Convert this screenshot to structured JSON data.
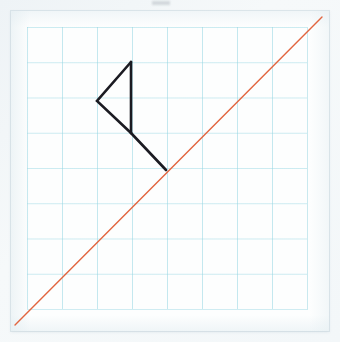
{
  "scene": {
    "title": "Hand drawing on graph paper",
    "width": 340,
    "height": 342,
    "background_color": "#f2f6f8",
    "paper_color": "#fdfefe",
    "grid_color": "#96d6e2",
    "grid_spacing_px": 35
  },
  "drawing": {
    "diagonal_line": {
      "label": "orange diagonal line",
      "color": "#e2653f",
      "stroke_width": 1.4,
      "x1": 15,
      "y1": 325,
      "x2": 322,
      "y2": 17
    },
    "flag": {
      "label": "black flag figure",
      "color": "#1b1b22",
      "stroke_width": 2.6,
      "triangle_points": "131,62 97,101 131,133",
      "pole": {
        "x1": 131,
        "y1": 133,
        "x2": 166,
        "y2": 170
      },
      "mast": {
        "x1": 131,
        "y1": 62,
        "x2": 131,
        "y2": 133
      }
    }
  },
  "annotations": {
    "smudge_label": "pencil smudge"
  }
}
